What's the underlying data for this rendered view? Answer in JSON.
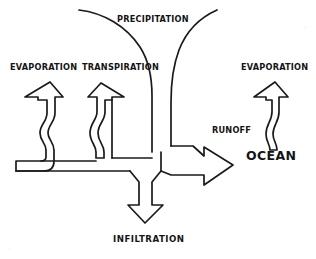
{
  "diagram": {
    "type": "hand-drawn-flow-diagram",
    "background_color": "#ffffff",
    "ink_color": "#1a1a1a",
    "labels": {
      "precipitation": "PRECIPITATION",
      "evaporation_left": "EVAPORATION",
      "transpiration": "TRANSPIRATION",
      "evaporation_right": "EVAPORATION",
      "runoff": "RUNOFF",
      "ocean": "OCEAN",
      "infiltration": "INFILTRATION"
    },
    "elements": [
      {
        "name": "precipitation-arc-left",
        "kind": "curve",
        "direction": "down-left"
      },
      {
        "name": "precipitation-arc-right",
        "kind": "curve",
        "direction": "down-right"
      },
      {
        "name": "evaporation-arrow-left",
        "kind": "outline-arrow",
        "direction": "up"
      },
      {
        "name": "transpiration-arrow",
        "kind": "outline-arrow",
        "direction": "up"
      },
      {
        "name": "evaporation-arrow-right",
        "kind": "outline-arrow",
        "direction": "up"
      },
      {
        "name": "runoff-arrow",
        "kind": "outline-arrow",
        "direction": "right"
      },
      {
        "name": "infiltration-arrow",
        "kind": "outline-arrow",
        "direction": "down"
      }
    ]
  }
}
